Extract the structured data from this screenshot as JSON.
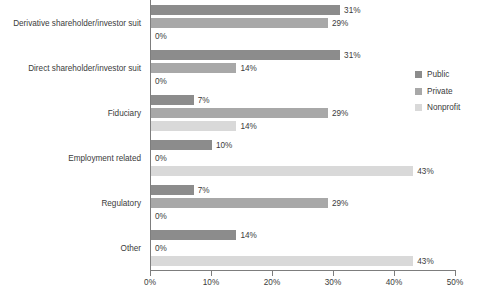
{
  "chart_data": {
    "type": "bar",
    "orientation": "horizontal",
    "title": "",
    "subtitle": "",
    "xlabel": "",
    "ylabel": "",
    "xlim": [
      0,
      50
    ],
    "grid": false,
    "legend_position": "right",
    "tick_labels": [
      "0%",
      "10%",
      "20%",
      "30%",
      "40%",
      "50%"
    ],
    "tick_values": [
      0,
      10,
      20,
      30,
      40,
      50
    ],
    "categories": [
      "Derivative shareholder/investor suit",
      "Direct shareholder/investor suit",
      "Fiduciary",
      "Employment related",
      "Regulatory",
      "Other"
    ],
    "series": [
      {
        "name": "Public",
        "color": "#8c8c8c",
        "values": [
          31,
          31,
          7,
          10,
          7,
          14
        ],
        "labels": [
          "31%",
          "31%",
          "7%",
          "10%",
          "7%",
          "14%"
        ]
      },
      {
        "name": "Private",
        "color": "#a8a8a8",
        "values": [
          29,
          14,
          29,
          0,
          29,
          0
        ],
        "labels": [
          "29%",
          "14%",
          "29%",
          "0%",
          "29%",
          "0%"
        ]
      },
      {
        "name": "Nonprofit",
        "color": "#d9d9d9",
        "values": [
          0,
          0,
          14,
          43,
          0,
          43
        ],
        "labels": [
          "0%",
          "0%",
          "14%",
          "43%",
          "0%",
          "43%"
        ]
      }
    ]
  },
  "legend": {
    "items": [
      {
        "label": "Public",
        "color": "#8c8c8c"
      },
      {
        "label": "Private",
        "color": "#a8a8a8"
      },
      {
        "label": "Nonprofit",
        "color": "#d9d9d9"
      }
    ]
  },
  "axis": {
    "line_color": "#7d7d7d",
    "text_color": "#3b3b3b"
  }
}
